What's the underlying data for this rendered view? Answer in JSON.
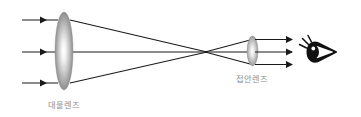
{
  "figure": {
    "background_color": "#ffffff",
    "width": 361,
    "height": 117
  },
  "labels": {
    "objective": "대물렌즈",
    "eyepiece": "접안렌즈",
    "label_color": "#8d8d8d"
  },
  "components": {
    "objective_lens": {
      "name": "objective-lens",
      "center_x": 64,
      "center_y": 51,
      "radius_x": 9,
      "radius_y": 39,
      "gradient_center_color": "#fdfdfd",
      "gradient_edge_color": "#6e6e6e"
    },
    "eyepiece_lens": {
      "name": "eyepiece-lens",
      "center_x": 252.5,
      "center_y": 51,
      "radius_x": 5.5,
      "radius_y": 15,
      "gradient_center_color": "#fdfdfd",
      "gradient_edge_color": "#767676"
    },
    "eye": {
      "name": "observer-eye",
      "center_x": 319,
      "center_y": 52,
      "fill_color": "#111111"
    },
    "focal_point": {
      "name": "focal-crossing-point",
      "x": 206,
      "y": 52
    }
  },
  "rays": {
    "stroke_color": "#1a1a1a",
    "incoming": [
      {
        "name": "incoming-ray-top",
        "x1": 22,
        "y1": 20,
        "x2": 58,
        "y2": 20,
        "arrow_x": 44
      },
      {
        "name": "incoming-ray-middle",
        "x1": 22,
        "y1": 52,
        "x2": 58,
        "y2": 52,
        "arrow_x": 44
      },
      {
        "name": "incoming-ray-bottom",
        "x1": 22,
        "y1": 83,
        "x2": 58,
        "y2": 83,
        "arrow_x": 44
      }
    ],
    "converging": [
      {
        "name": "converging-ray-top",
        "x1": 70,
        "y1": 20,
        "x2": 206,
        "y2": 52
      },
      {
        "name": "converging-ray-middle",
        "x1": 70,
        "y1": 52,
        "x2": 206,
        "y2": 52
      },
      {
        "name": "converging-ray-bottom",
        "x1": 70,
        "y1": 83,
        "x2": 206,
        "y2": 52
      }
    ],
    "diverging": [
      {
        "name": "diverging-ray-top",
        "x1": 206,
        "y1": 52,
        "x2": 251,
        "y2": 40
      },
      {
        "name": "diverging-ray-middle",
        "x1": 206,
        "y1": 52,
        "x2": 251,
        "y2": 52
      },
      {
        "name": "diverging-ray-bottom",
        "x1": 206,
        "y1": 52,
        "x2": 251,
        "y2": 64
      }
    ],
    "outgoing": [
      {
        "name": "outgoing-ray-top",
        "x1": 256,
        "y1": 40,
        "x2": 291,
        "y2": 40
      },
      {
        "name": "outgoing-ray-middle",
        "x1": 256,
        "y1": 52,
        "x2": 291,
        "y2": 52
      },
      {
        "name": "outgoing-ray-bottom",
        "x1": 256,
        "y1": 64,
        "x2": 291,
        "y2": 64
      }
    ]
  },
  "label_positions": {
    "objective": {
      "x": 64,
      "y": 108
    },
    "eyepiece": {
      "x": 252,
      "y": 82
    }
  }
}
